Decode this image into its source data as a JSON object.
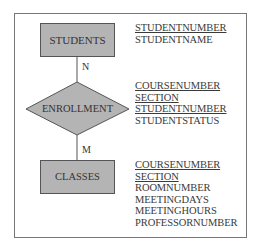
{
  "diagram": {
    "type": "entity-relationship",
    "entities": [
      {
        "name": "STUDENTS",
        "attributes": [
          {
            "name": "STUDENTNUMBER",
            "key": true
          },
          {
            "name": "STUDENTNAME",
            "key": false
          }
        ]
      },
      {
        "name": "CLASSES",
        "attributes": [
          {
            "name": "COURSENUMBER",
            "key": true
          },
          {
            "name": "SECTION",
            "key": true
          },
          {
            "name": "ROOMNUMBER",
            "key": false
          },
          {
            "name": "MEETINGDAYS",
            "key": false
          },
          {
            "name": "MEETINGHOURS",
            "key": false
          },
          {
            "name": "PROFESSORNUMBER",
            "key": false
          }
        ]
      }
    ],
    "relationship": {
      "name": "ENROLLMENT",
      "attributes": [
        {
          "name": "COURSENUMBER",
          "key": true
        },
        {
          "name": "SECTION",
          "key": true
        },
        {
          "name": "STUDENTNUMBER",
          "key": true
        },
        {
          "name": "STUDENTSTATUS",
          "key": false
        }
      ]
    },
    "cardinality": {
      "students_side": "N",
      "classes_side": "M"
    },
    "colors": {
      "entity_fill": "#b4b4b4",
      "stroke": "#555555",
      "frame": "#777777"
    }
  }
}
